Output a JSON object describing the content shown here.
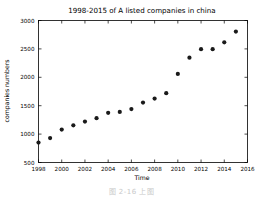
{
  "figure": {
    "caption": "图 2-16  上图"
  },
  "chart_data": {
    "type": "scatter",
    "title": "1998-2015 of A listed companies in china",
    "xlabel": "Time",
    "ylabel": "companies numbers",
    "xlim": [
      1998,
      2016
    ],
    "ylim": [
      500,
      3000
    ],
    "xticks": [
      1998,
      2000,
      2002,
      2004,
      2006,
      2008,
      2010,
      2012,
      2014,
      2016
    ],
    "yticks": [
      500,
      1000,
      1500,
      2000,
      2500,
      3000
    ],
    "xtick_labels": [
      "1998",
      "2000",
      "2002",
      "2004",
      "2006",
      "2008",
      "2010",
      "2012",
      "2014",
      "2016"
    ],
    "ytick_labels": [
      "500",
      "1000",
      "1500",
      "2000",
      "2500",
      "3000"
    ],
    "grid": false,
    "legend": null,
    "marker": "circle",
    "marker_color": "#1a1a1a",
    "x": [
      1998,
      1999,
      2000,
      2001,
      2002,
      2003,
      2004,
      2005,
      2006,
      2007,
      2008,
      2009,
      2010,
      2011,
      2012,
      2013,
      2014,
      2015
    ],
    "values": [
      851,
      930,
      1080,
      1155,
      1220,
      1280,
      1375,
      1390,
      1440,
      1555,
      1625,
      1720,
      2060,
      2345,
      2495,
      2495,
      2615,
      2805
    ],
    "series": [
      {
        "name": "companies numbers",
        "values": [
          851,
          930,
          1080,
          1155,
          1220,
          1280,
          1375,
          1390,
          1440,
          1555,
          1625,
          1720,
          2060,
          2345,
          2495,
          2495,
          2615,
          2805
        ]
      }
    ]
  }
}
